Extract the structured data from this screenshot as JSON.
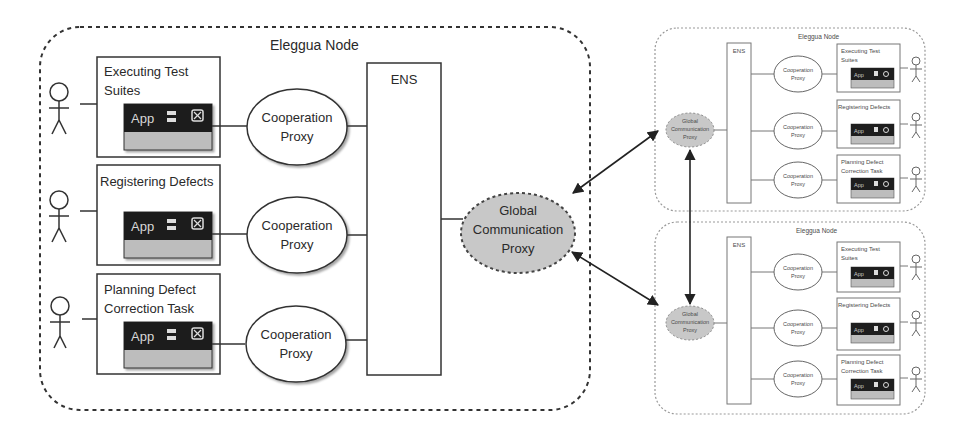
{
  "diagram": {
    "main_node": {
      "title": "Eleggua Node",
      "ens_label": "ENS",
      "global_proxy": {
        "line1": "Global",
        "line2": "Communication",
        "line3": "Proxy"
      },
      "tasks": [
        {
          "line1": "Executing Test",
          "line2": "Suites",
          "app_label": "App",
          "proxy_line1": "Cooperation",
          "proxy_line2": "Proxy"
        },
        {
          "line1": "Registering Defects",
          "line2": "",
          "app_label": "App",
          "proxy_line1": "Cooperation",
          "proxy_line2": "Proxy"
        },
        {
          "line1": "Planning Defect",
          "line2": "Correction Task",
          "app_label": "App",
          "proxy_line1": "Cooperation",
          "proxy_line2": "Proxy"
        }
      ]
    },
    "remote_nodes": [
      {
        "title": "Eleggua Node",
        "ens_label": "ENS",
        "global_proxy": {
          "line1": "Global",
          "line2": "Communication",
          "line3": "Proxy"
        },
        "tasks": [
          {
            "line1": "Executing Test",
            "line2": "Suites",
            "app_label": "App",
            "proxy_line1": "Cooperation",
            "proxy_line2": "Proxy"
          },
          {
            "line1": "Registering Defects",
            "line2": "",
            "app_label": "App",
            "proxy_line1": "Cooperation",
            "proxy_line2": "Proxy"
          },
          {
            "line1": "Planning Defect",
            "line2": "Correction Task",
            "app_label": "App",
            "proxy_line1": "Cooperation",
            "proxy_line2": "Proxy"
          }
        ]
      },
      {
        "title": "Eleggua Node",
        "ens_label": "ENS",
        "global_proxy": {
          "line1": "Global",
          "line2": "Communication",
          "line3": "Proxy"
        },
        "tasks": [
          {
            "line1": "Executing Test",
            "line2": "Suites",
            "app_label": "App",
            "proxy_line1": "Cooperation",
            "proxy_line2": "Proxy"
          },
          {
            "line1": "Registering Defects",
            "line2": "",
            "app_label": "App",
            "proxy_line1": "Cooperation",
            "proxy_line2": "Proxy"
          },
          {
            "line1": "Planning Defect",
            "line2": "Correction Task",
            "app_label": "App",
            "proxy_line1": "Cooperation",
            "proxy_line2": "Proxy"
          }
        ]
      }
    ],
    "colors": {
      "stroke": "#333333",
      "proxy_fill": "#c8c8c8",
      "app_title_bar": "#1e1e1e",
      "app_body": "#bdbdbd",
      "remote_stroke": "#8a8a8a"
    }
  }
}
